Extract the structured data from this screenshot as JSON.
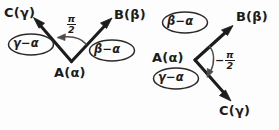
{
  "figure": {
    "background_color": "#fdfdfd",
    "ink_color": "#1c1c1c",
    "arc_color": "#4d4d4d"
  },
  "left_diagram": {
    "name": "counterclockwise-angle-diagram",
    "vertex_label": "A(α)",
    "upper_left_label": "C(γ)",
    "upper_right_label": "B(β)",
    "left_ellipse_label": "γ−α",
    "right_ellipse_label": "β−α",
    "angle_sign": "",
    "angle_numerator": "π",
    "angle_denominator": "2",
    "angle_label": "π/2",
    "arc_direction": "counterclockwise"
  },
  "right_diagram": {
    "name": "clockwise-angle-diagram",
    "vertex_label": "A(α)",
    "upper_right_label": "B(β)",
    "lower_right_label": "C(γ)",
    "upper_ellipse_label": "β−α",
    "lower_ellipse_label": "γ−α",
    "angle_sign": "−",
    "angle_numerator": "π",
    "angle_denominator": "2",
    "angle_label": "−π/2",
    "arc_direction": "clockwise"
  }
}
